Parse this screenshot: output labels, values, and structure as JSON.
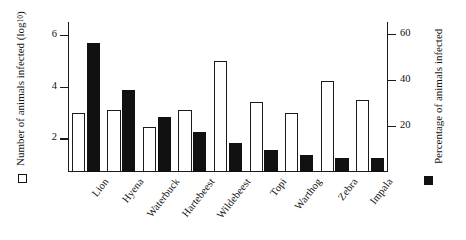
{
  "chart_data": {
    "type": "bar",
    "title": "",
    "categories": [
      "Lion",
      "Hyena",
      "Waterbuck",
      "Hartebeest",
      "Wildebeest",
      "Topi",
      "Warthog",
      "Zebra",
      "Impala"
    ],
    "series": [
      {
        "name": "Number of animals infected (log10)",
        "marker": "open-square",
        "axis": "left",
        "values": [
          3.0,
          3.1,
          2.45,
          3.1,
          5.0,
          3.4,
          3.0,
          4.2,
          3.5
        ]
      },
      {
        "name": "Percentage of animals infected",
        "marker": "filled-square",
        "axis": "right",
        "values": [
          56,
          35.5,
          24,
          17.5,
          12.5,
          9.5,
          7.5,
          6,
          6
        ]
      }
    ],
    "left_axis": {
      "label": "Number of animals infected (log",
      "label_sub": "10",
      "label_suffix": ")",
      "ticks": [
        2,
        4,
        6
      ],
      "tick_labels": [
        "2",
        "4",
        "6"
      ],
      "lim": [
        0.7,
        6.5
      ]
    },
    "right_axis": {
      "label_line1": "Percentage of",
      "label_line2": "animals infected",
      "ticks": [
        20,
        40,
        60
      ],
      "tick_labels": [
        "20",
        "40",
        "60"
      ],
      "lim": [
        0,
        65
      ]
    },
    "xlabel": "",
    "grid": false,
    "legend_position": "outside-left-and-right"
  }
}
